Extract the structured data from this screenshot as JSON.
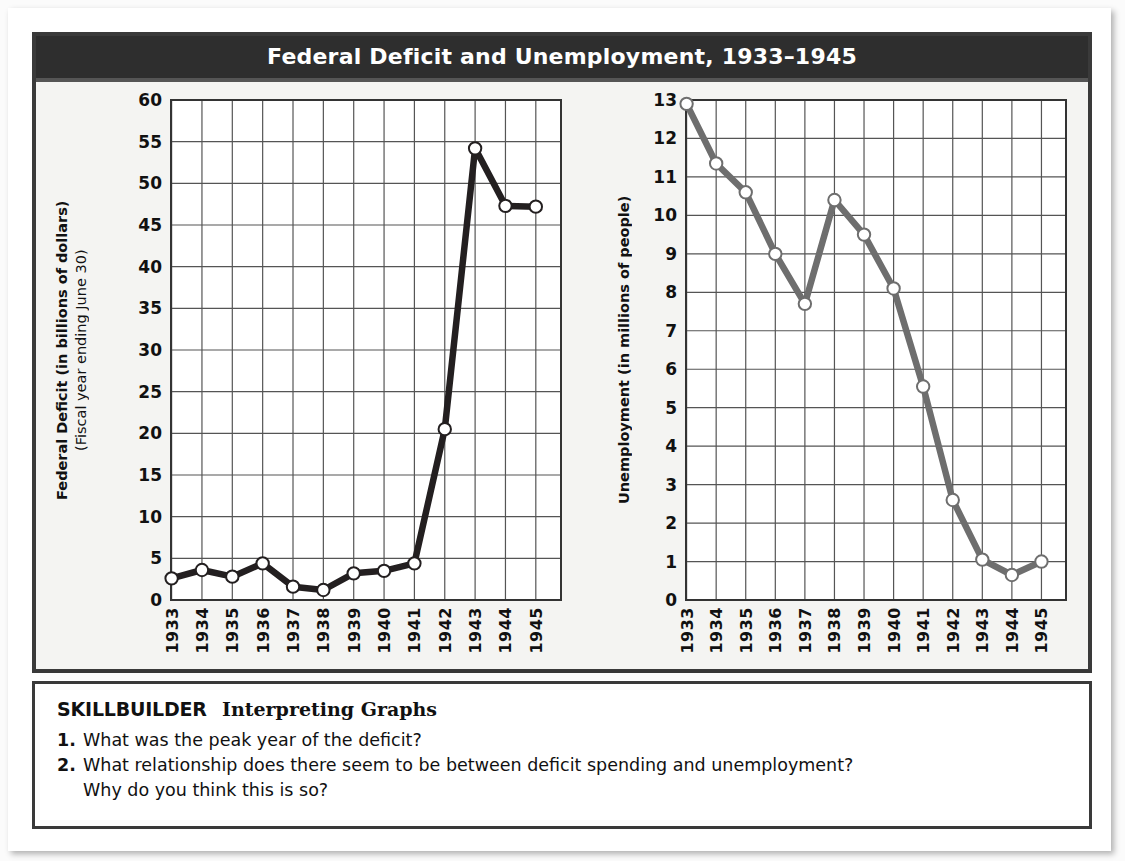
{
  "figure": {
    "title": "Federal Deficit and Unemployment, 1933–1945",
    "colors": {
      "frame": "#3a3a3a",
      "title_bar": "#2e2e2e",
      "plot_background": "#ffffff",
      "card_background": "#f4f4f2",
      "deficit_line": "#231f20",
      "unemployment_line": "#6e6e6e",
      "gridline": "#555555",
      "marker_fill": "#ffffff"
    }
  },
  "chart_data": [
    {
      "type": "line",
      "title": "Federal Deficit",
      "ylabel": "Federal Deficit (in billions of dollars)",
      "ylabel_sub": "(Fiscal year ending June 30)",
      "xlabel": "",
      "x": [
        "1933",
        "1934",
        "1935",
        "1936",
        "1937",
        "1938",
        "1939",
        "1940",
        "1941",
        "1942",
        "1943",
        "1944",
        "1945"
      ],
      "values": [
        2.6,
        3.6,
        2.8,
        4.4,
        1.6,
        1.2,
        3.2,
        3.5,
        4.4,
        20.5,
        54.2,
        47.3,
        47.2
      ],
      "ylim": [
        0,
        60
      ],
      "yticks": [
        0,
        5,
        10,
        15,
        20,
        25,
        30,
        35,
        40,
        45,
        50,
        55,
        60
      ],
      "grid": true,
      "legend": "none",
      "marker": "open-circle"
    },
    {
      "type": "line",
      "title": "Unemployment",
      "ylabel": "Unemployment (in millions of people)",
      "ylabel_sub": "",
      "xlabel": "",
      "x": [
        "1933",
        "1934",
        "1935",
        "1936",
        "1937",
        "1938",
        "1939",
        "1940",
        "1941",
        "1942",
        "1943",
        "1944",
        "1945"
      ],
      "values": [
        12.9,
        11.35,
        10.6,
        9.0,
        7.7,
        10.4,
        9.5,
        8.1,
        5.55,
        2.6,
        1.05,
        0.65,
        1.0
      ],
      "ylim": [
        0,
        13
      ],
      "yticks": [
        0,
        1,
        2,
        3,
        4,
        5,
        6,
        7,
        8,
        9,
        10,
        11,
        12,
        13
      ],
      "grid": true,
      "legend": "none",
      "marker": "open-circle"
    }
  ],
  "skillbuilder": {
    "label": "SKILLBUILDER",
    "subtitle": "Interpreting Graphs",
    "questions": [
      {
        "num": "1.",
        "text": "What was the peak year of the deficit?",
        "continuation": ""
      },
      {
        "num": "2.",
        "text": "What relationship does there seem to be between deficit spending and unemployment?",
        "continuation": "Why do you think this is so?"
      }
    ]
  }
}
